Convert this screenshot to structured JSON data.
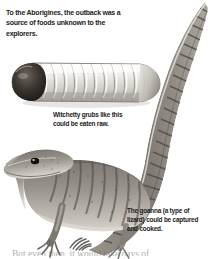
{
  "page": {
    "background_color": "#ffffff",
    "text_color": "#1c1c1c"
  },
  "intro": {
    "text": "To the Aborigines, the outback was a source of foods unknown to the explorers."
  },
  "captions": [
    {
      "id": "witchetty-grub",
      "text": "Witchetty grubs like this could be eaten raw."
    },
    {
      "id": "goanna",
      "text": "The goanna (a type of lizard) could be captured and cooked."
    }
  ],
  "illustrations": [
    {
      "id": "witchetty-grub-illustration",
      "subject": "witchetty grub",
      "description": "Large pale segmented larva with a dark brown head at the left end, shown in side view.",
      "body_color": "#d9d7d2",
      "head_color": "#3a3430",
      "segment_count": 12
    },
    {
      "id": "goanna-illustration",
      "subject": "goanna lizard",
      "description": "Grey-brown monitor lizard in side view with a long banded tail curving up to the top right, a clawed front foot, and a dark eye.",
      "body_color": "#8b8780",
      "band_color": "#4a453f",
      "eye_color": "#16120f"
    }
  ],
  "bottom_text": {
    "text": "But even then, it would take days of"
  }
}
